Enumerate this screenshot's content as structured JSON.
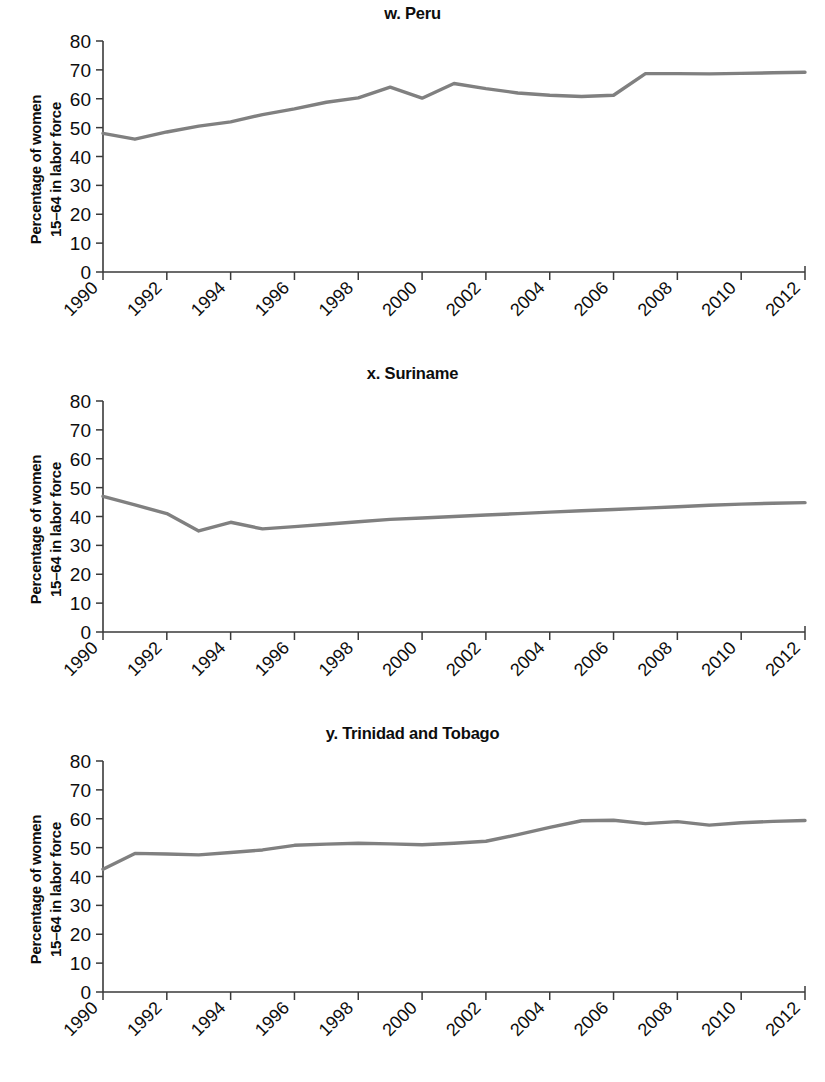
{
  "figure": {
    "y_axis_label_line1": "Percentage of women",
    "y_axis_label_line2": "15–64 in labor force",
    "line_color": "#808080",
    "axis_color": "#3a3a3a"
  },
  "panels": [
    {
      "title": "w. Peru"
    },
    {
      "title": "x. Suriname"
    },
    {
      "title": "y. Trinidad and Tobago"
    }
  ],
  "chart_data": [
    {
      "type": "line",
      "title": "w. Peru",
      "xlabel": "",
      "ylabel": "Percentage of women 15–64 in labor force",
      "xlim": [
        1990,
        2012
      ],
      "ylim": [
        0,
        80
      ],
      "yticks": [
        0,
        10,
        20,
        30,
        40,
        50,
        60,
        70,
        80
      ],
      "xticks": [
        1990,
        1992,
        1994,
        1996,
        1998,
        2000,
        2002,
        2004,
        2006,
        2008,
        2010,
        2012
      ],
      "grid": false,
      "legend": "none",
      "x": [
        1990,
        1991,
        1992,
        1993,
        1994,
        1995,
        1996,
        1997,
        1998,
        1999,
        2000,
        2001,
        2002,
        2003,
        2004,
        2005,
        2006,
        2007,
        2008,
        2009,
        2010,
        2011,
        2012
      ],
      "values": [
        48.0,
        46.0,
        48.5,
        50.5,
        52.0,
        54.5,
        56.5,
        58.8,
        60.3,
        64.0,
        60.2,
        65.3,
        63.5,
        62.0,
        61.2,
        60.8,
        61.2,
        68.7,
        68.7,
        68.6,
        68.8,
        69.0,
        69.2
      ]
    },
    {
      "type": "line",
      "title": "x. Suriname",
      "xlabel": "",
      "ylabel": "Percentage of women 15–64 in labor force",
      "xlim": [
        1990,
        2012
      ],
      "ylim": [
        0,
        80
      ],
      "yticks": [
        0,
        10,
        20,
        30,
        40,
        50,
        60,
        70,
        80
      ],
      "xticks": [
        1990,
        1992,
        1994,
        1996,
        1998,
        2000,
        2002,
        2004,
        2006,
        2008,
        2010,
        2012
      ],
      "grid": false,
      "legend": "none",
      "x": [
        1990,
        1991,
        1992,
        1993,
        1994,
        1995,
        1996,
        1997,
        1998,
        1999,
        2000,
        2001,
        2002,
        2003,
        2004,
        2005,
        2006,
        2007,
        2008,
        2009,
        2010,
        2011,
        2012
      ],
      "values": [
        47.0,
        44.0,
        41.0,
        35.0,
        38.0,
        35.7,
        36.5,
        37.3,
        38.2,
        39.0,
        39.5,
        40.0,
        40.5,
        41.0,
        41.5,
        42.0,
        42.4,
        42.9,
        43.4,
        43.9,
        44.3,
        44.6,
        44.8
      ]
    },
    {
      "type": "line",
      "title": "y. Trinidad and Tobago",
      "xlabel": "",
      "ylabel": "Percentage of women 15–64 in labor force",
      "xlim": [
        1990,
        2012
      ],
      "ylim": [
        0,
        80
      ],
      "yticks": [
        0,
        10,
        20,
        30,
        40,
        50,
        60,
        70,
        80
      ],
      "xticks": [
        1990,
        1992,
        1994,
        1996,
        1998,
        2000,
        2002,
        2004,
        2006,
        2008,
        2010,
        2012
      ],
      "grid": false,
      "legend": "none",
      "x": [
        1990,
        1991,
        1992,
        1993,
        1994,
        1995,
        1996,
        1997,
        1998,
        1999,
        2000,
        2001,
        2002,
        2003,
        2004,
        2005,
        2006,
        2007,
        2008,
        2009,
        2010,
        2011,
        2012
      ],
      "values": [
        42.5,
        48.0,
        47.8,
        47.5,
        48.3,
        49.2,
        50.8,
        51.2,
        51.5,
        51.3,
        51.0,
        51.5,
        52.2,
        54.5,
        57.0,
        59.3,
        59.5,
        58.3,
        59.0,
        57.8,
        58.6,
        59.1,
        59.4
      ]
    }
  ]
}
